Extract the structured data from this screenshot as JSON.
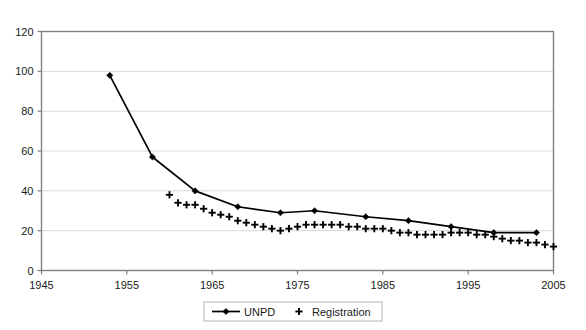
{
  "chart_data": {
    "type": "line",
    "title": "",
    "xlabel": "",
    "ylabel": "",
    "xlim": [
      1945,
      2005
    ],
    "ylim": [
      0,
      120
    ],
    "xticks": [
      1945,
      1955,
      1965,
      1975,
      1985,
      1995,
      2005
    ],
    "yticks": [
      0,
      20,
      40,
      60,
      80,
      100,
      120
    ],
    "grid": true,
    "grid_axis": "y",
    "legend_position": "bottom-center",
    "series": [
      {
        "name": "UNPD",
        "marker": "diamond",
        "line": true,
        "color": "#000000",
        "x": [
          1953,
          1958,
          1963,
          1968,
          1973,
          1977,
          1983,
          1988,
          1993,
          1998,
          2003
        ],
        "y": [
          98,
          57,
          40,
          32,
          29,
          30,
          27,
          25,
          22,
          19,
          19
        ]
      },
      {
        "name": "Registration",
        "marker": "plus",
        "line": false,
        "color": "#000000",
        "x": [
          1960,
          1961,
          1962,
          1963,
          1964,
          1965,
          1966,
          1967,
          1968,
          1969,
          1970,
          1971,
          1972,
          1973,
          1974,
          1975,
          1976,
          1977,
          1978,
          1979,
          1980,
          1981,
          1982,
          1983,
          1984,
          1985,
          1986,
          1987,
          1988,
          1989,
          1990,
          1991,
          1992,
          1993,
          1994,
          1995,
          1996,
          1997,
          1998,
          1999,
          2000,
          2001,
          2002,
          2003,
          2004,
          2005
        ],
        "y": [
          38,
          34,
          33,
          33,
          31,
          29,
          28,
          27,
          25,
          24,
          23,
          22,
          21,
          20,
          21,
          22,
          23,
          23,
          23,
          23,
          23,
          22,
          22,
          21,
          21,
          21,
          20,
          19,
          19,
          18,
          18,
          18,
          18,
          19,
          19,
          19,
          18,
          18,
          17,
          16,
          15,
          15,
          14,
          14,
          13,
          12
        ]
      }
    ]
  },
  "legend": {
    "items": [
      {
        "label": "UNPD",
        "symbol": "line-diamond"
      },
      {
        "label": "Registration",
        "symbol": "plus"
      }
    ]
  },
  "colors": {
    "series": "#000000",
    "grid": "#d9d9d9",
    "axis": "#808080",
    "text": "#1a1a1a",
    "background": "#ffffff"
  }
}
